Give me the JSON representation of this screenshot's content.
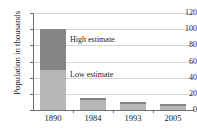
{
  "chart_data": {
    "type": "bar",
    "title": "",
    "subtitle": "",
    "xlabel": "",
    "ylabel": "Population in thousands",
    "categories": [
      "1890",
      "1984",
      "1993",
      "2005"
    ],
    "series": [
      {
        "name": "Low estimate",
        "values": [
          50,
          12,
          8,
          5
        ],
        "color": "#b6b6b6"
      },
      {
        "name": "High estimate",
        "values": [
          50,
          3,
          2,
          2
        ],
        "color": "#858585"
      }
    ],
    "totals": [
      100,
      15,
      10,
      7
    ],
    "stacked": true,
    "ylim": [
      0,
      120
    ],
    "yticks": [
      0,
      20,
      40,
      60,
      80,
      100,
      120
    ],
    "ytick_labels": [
      "0",
      "20",
      "40",
      "60",
      "80",
      "100",
      "120"
    ],
    "grid": true,
    "grid_axis": "y",
    "legend": "inline-annotations",
    "annotations": [
      {
        "text": "High estimate",
        "target": "high-estimate-segment"
      },
      {
        "text": "Low estimate",
        "target": "low-estimate-segment"
      }
    ]
  },
  "annotations": {
    "high": "High estimate",
    "low": "Low estimate"
  }
}
